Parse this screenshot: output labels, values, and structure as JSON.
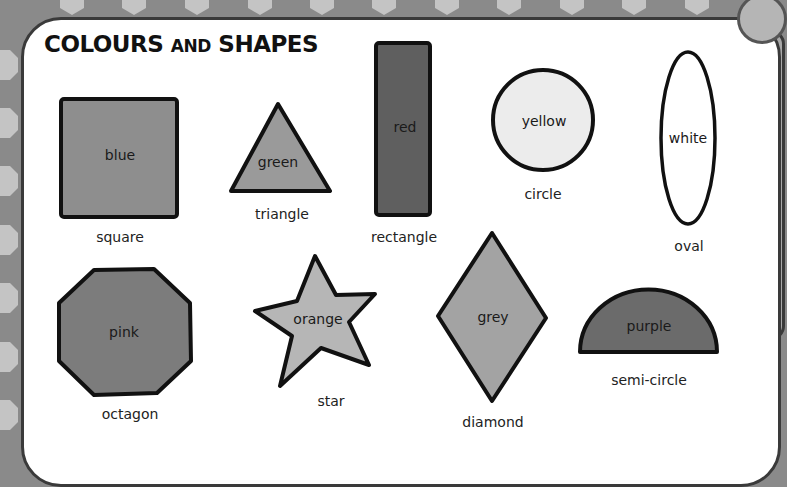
{
  "title": {
    "part1": "COLOURS",
    "part2": "AND",
    "part3": "SHAPES"
  },
  "colors": {
    "background": "#8a8a8a",
    "panel": "#ffffff",
    "border": "#111111"
  },
  "shapes": [
    {
      "name": "square",
      "colour": "blue",
      "fill": "#8e8e8e"
    },
    {
      "name": "triangle",
      "colour": "green",
      "fill": "#9a9a9a"
    },
    {
      "name": "rectangle",
      "colour": "red",
      "fill": "#5f5f5f"
    },
    {
      "name": "circle",
      "colour": "yellow",
      "fill": "#ececec"
    },
    {
      "name": "oval",
      "colour": "white",
      "fill": "#ffffff"
    },
    {
      "name": "octagon",
      "colour": "pink",
      "fill": "#7c7c7c"
    },
    {
      "name": "star",
      "colour": "orange",
      "fill": "#b6b6b6"
    },
    {
      "name": "diamond",
      "colour": "grey",
      "fill": "#a3a3a3"
    },
    {
      "name": "semi-circle",
      "colour": "purple",
      "fill": "#6b6b6b"
    }
  ]
}
